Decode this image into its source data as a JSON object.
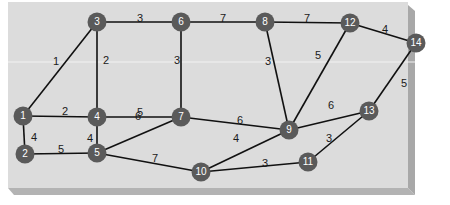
{
  "diagram": {
    "type": "weighted-undirected-graph",
    "colors": {
      "panel": "#dcdcdc",
      "panel_edge_right": "#a9a9a9",
      "panel_edge_bottom": "#b0b0b0",
      "node_fill": "#5a5a5a",
      "node_text": "#ffffff",
      "edge": "#111111",
      "edge_label": "#1a1a1a"
    },
    "nodes": [
      {
        "id": "1",
        "x": 23,
        "y": 116
      },
      {
        "id": "2",
        "x": 25,
        "y": 154
      },
      {
        "id": "3",
        "x": 97,
        "y": 22
      },
      {
        "id": "4",
        "x": 97,
        "y": 117
      },
      {
        "id": "5",
        "x": 97,
        "y": 153
      },
      {
        "id": "6",
        "x": 181,
        "y": 22
      },
      {
        "id": "7",
        "x": 181,
        "y": 117
      },
      {
        "id": "8",
        "x": 265,
        "y": 22
      },
      {
        "id": "9",
        "x": 289,
        "y": 130
      },
      {
        "id": "10",
        "x": 201,
        "y": 172
      },
      {
        "id": "11",
        "x": 308,
        "y": 162
      },
      {
        "id": "12",
        "x": 350,
        "y": 23
      },
      {
        "id": "13",
        "x": 369,
        "y": 111
      },
      {
        "id": "14",
        "x": 416,
        "y": 43
      }
    ],
    "edges": [
      {
        "from": "1",
        "to": "3",
        "weight": "1",
        "lx": 56,
        "ly": 62
      },
      {
        "from": "1",
        "to": "4",
        "weight": "2",
        "lx": 65,
        "ly": 112
      },
      {
        "from": "1",
        "to": "2",
        "weight": "4",
        "lx": 34,
        "ly": 138
      },
      {
        "from": "3",
        "to": "6",
        "weight": "3",
        "lx": 140,
        "ly": 19
      },
      {
        "from": "3",
        "to": "4",
        "weight": "2",
        "lx": 106,
        "ly": 61
      },
      {
        "from": "2",
        "to": "5",
        "weight": "5",
        "lx": 61,
        "ly": 150
      },
      {
        "from": "4",
        "to": "5",
        "weight": "4",
        "lx": 90,
        "ly": 139
      },
      {
        "from": "4",
        "to": "7",
        "weight": "5",
        "lx": 140,
        "ly": 113
      },
      {
        "from": "5",
        "to": "7",
        "weight": "6",
        "lx": 138,
        "ly": 117
      },
      {
        "from": "5",
        "to": "10",
        "weight": "7",
        "lx": 155,
        "ly": 159
      },
      {
        "from": "6",
        "to": "8",
        "weight": "7",
        "lx": 223,
        "ly": 19
      },
      {
        "from": "6",
        "to": "7",
        "weight": "3",
        "lx": 177,
        "ly": 61
      },
      {
        "from": "7",
        "to": "9",
        "weight": "6",
        "lx": 240,
        "ly": 121
      },
      {
        "from": "8",
        "to": "12",
        "weight": "7",
        "lx": 307,
        "ly": 19
      },
      {
        "from": "8",
        "to": "9",
        "weight": "3",
        "lx": 268,
        "ly": 62
      },
      {
        "from": "9",
        "to": "12",
        "weight": "5",
        "lx": 318,
        "ly": 56
      },
      {
        "from": "9",
        "to": "13",
        "weight": "6",
        "lx": 331,
        "ly": 106
      },
      {
        "from": "9",
        "to": "10",
        "weight": "4",
        "lx": 236,
        "ly": 139
      },
      {
        "from": "10",
        "to": "11",
        "weight": "3",
        "lx": 265,
        "ly": 164
      },
      {
        "from": "11",
        "to": "13",
        "weight": "3",
        "lx": 329,
        "ly": 139
      },
      {
        "from": "12",
        "to": "14",
        "weight": "4",
        "lx": 385,
        "ly": 30
      },
      {
        "from": "13",
        "to": "14",
        "weight": "5",
        "lx": 404,
        "ly": 84
      }
    ]
  }
}
